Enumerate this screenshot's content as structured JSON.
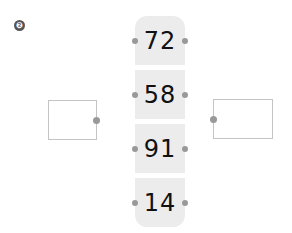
{
  "problem_badge": "❷",
  "cells": [
    {
      "value": "72"
    },
    {
      "value": "58"
    },
    {
      "value": "91"
    },
    {
      "value": "14"
    }
  ],
  "left_box": {
    "value": ""
  },
  "right_box": {
    "value": ""
  }
}
